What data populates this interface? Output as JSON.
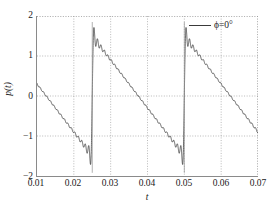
{
  "chart_data": {
    "type": "line",
    "title": "",
    "subtitle": "",
    "xlabel": "t",
    "ylabel": "p(t)",
    "xlim": [
      0.01,
      0.07
    ],
    "ylim": [
      -2,
      2
    ],
    "xticks": [
      0.01,
      0.02,
      0.03,
      0.04,
      0.05,
      0.06,
      0.07
    ],
    "xtick_labels": [
      "0.01",
      "0.02",
      "0.03",
      "0.04",
      "0.05",
      "0.06",
      "0.07"
    ],
    "yticks": [
      2,
      1,
      0,
      -1,
      -2
    ],
    "ytick_labels": [
      "2",
      "1",
      "0",
      "-1",
      "-2"
    ],
    "grid": true,
    "grid_style": "dotted",
    "legend_position": "top-right",
    "legend": [
      {
        "label": "ϕ=0°",
        "color": "#2a2a2a"
      }
    ],
    "series": [
      {
        "name": "ϕ=0°",
        "color": "#2a2a2a",
        "waveform": "descending sawtooth (Fourier partial sum with Gibbs ringing)",
        "period": 0.025,
        "amplitude": 1.5,
        "discontinuities": [
          0.025,
          0.05
        ],
        "description": "Falls linearly from +1.5 to -1.5 over each period, then jumps back up; overshoot ringing at each jump reaches about +1.8 and -1.8.",
        "points": [
          {
            "t": 0.01,
            "p": 0.3
          },
          {
            "t": 0.0125,
            "p": 0.0
          },
          {
            "t": 0.015,
            "p": -0.3
          },
          {
            "t": 0.02,
            "p": -0.9
          },
          {
            "t": 0.0245,
            "p": -1.5
          },
          {
            "t": 0.0249,
            "p": -1.8
          },
          {
            "t": 0.0251,
            "p": 1.8
          },
          {
            "t": 0.0255,
            "p": 1.5
          },
          {
            "t": 0.03,
            "p": 1.2
          },
          {
            "t": 0.0375,
            "p": 0.0
          },
          {
            "t": 0.045,
            "p": -0.9
          },
          {
            "t": 0.0495,
            "p": -1.5
          },
          {
            "t": 0.0499,
            "p": -1.8
          },
          {
            "t": 0.0501,
            "p": 1.8
          },
          {
            "t": 0.0505,
            "p": 1.5
          },
          {
            "t": 0.06,
            "p": 0.3
          },
          {
            "t": 0.0625,
            "p": 0.0
          },
          {
            "t": 0.07,
            "p": -0.9
          }
        ]
      }
    ]
  }
}
